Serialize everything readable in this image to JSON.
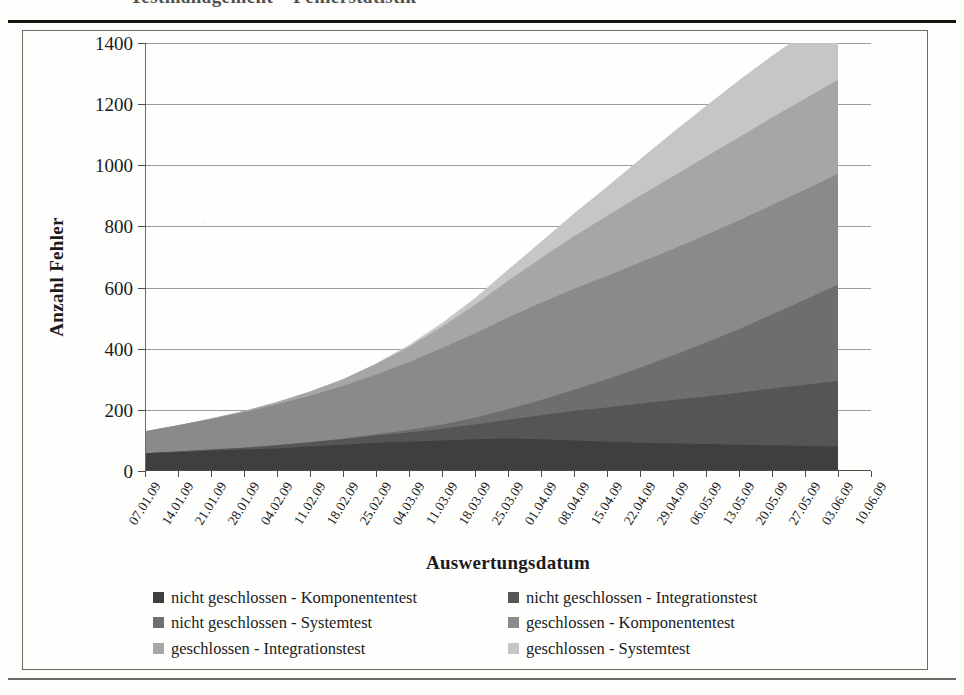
{
  "page": {
    "clipped_heading": "Testmanagement – Fehlerstatistik"
  },
  "chart_data": {
    "type": "area",
    "stacked": true,
    "title": "",
    "xlabel": "Auswertungsdatum",
    "ylabel": "Anzahl Fehler",
    "ylim": [
      0,
      1400
    ],
    "ytick_step": 200,
    "yticks": [
      0,
      200,
      400,
      600,
      800,
      1000,
      1200,
      1400
    ],
    "grid": true,
    "legend_position": "bottom",
    "legend_columns": 2,
    "categories": [
      "07.01.09",
      "14.01.09",
      "21.01.09",
      "28.01.09",
      "04.02.09",
      "11.02.09",
      "18.02.09",
      "25.02.09",
      "04.03.09",
      "11.03.09",
      "18.03.09",
      "25.03.09",
      "01.04.09",
      "08.04.09",
      "15.04.09",
      "22.04.09",
      "29.04.09",
      "06.05.09",
      "13.05.09",
      "20.05.09",
      "27.05.09",
      "03.06.09",
      "10.06.09"
    ],
    "series": [
      {
        "name": "nicht geschlossen - Komponententest",
        "color": "#3f3f3f",
        "values": [
          58,
          62,
          66,
          70,
          74,
          80,
          86,
          92,
          96,
          100,
          104,
          106,
          104,
          100,
          96,
          92,
          90,
          88,
          86,
          84,
          82,
          80,
          null
        ]
      },
      {
        "name": "nicht geschlossen - Integrationstest",
        "color": "#555555",
        "values": [
          0,
          2,
          4,
          6,
          10,
          14,
          18,
          24,
          30,
          38,
          48,
          62,
          78,
          96,
          112,
          128,
          142,
          156,
          170,
          186,
          200,
          214,
          null
        ]
      },
      {
        "name": "nicht geschlossen - Systemtest",
        "color": "#6e6e6e",
        "values": [
          0,
          0,
          0,
          0,
          0,
          0,
          2,
          4,
          8,
          14,
          22,
          34,
          50,
          70,
          92,
          118,
          146,
          176,
          208,
          242,
          278,
          316,
          null
        ]
      },
      {
        "name": "geschlossen - Komponententest",
        "color": "#8a8a8a",
        "values": [
          72,
          86,
          100,
          116,
          134,
          152,
          172,
          196,
          222,
          250,
          276,
          300,
          318,
          330,
          338,
          344,
          348,
          352,
          356,
          358,
          360,
          362,
          null
        ]
      },
      {
        "name": "geschlossen - Integrationstest",
        "color": "#a6a6a6",
        "values": [
          0,
          0,
          2,
          4,
          8,
          14,
          22,
          34,
          50,
          70,
          94,
          120,
          146,
          172,
          196,
          218,
          238,
          256,
          272,
          286,
          298,
          308,
          null
        ]
      },
      {
        "name": "geschlossen - Systemtest",
        "color": "#c6c6c6",
        "values": [
          0,
          0,
          0,
          0,
          0,
          0,
          0,
          2,
          6,
          12,
          22,
          36,
          54,
          74,
          96,
          120,
          144,
          166,
          186,
          202,
          214,
          224,
          null
        ]
      }
    ],
    "totals": [
      130,
      150,
      172,
      196,
      226,
      260,
      300,
      352,
      412,
      484,
      566,
      658,
      750,
      842,
      930,
      1020,
      1108,
      1194,
      1278,
      1358,
      1432,
      1504,
      null
    ],
    "peak_total_label": "1255"
  },
  "legend": {
    "items": [
      {
        "label": "nicht geschlossen - Komponententest",
        "color": "#3f3f3f"
      },
      {
        "label": "nicht geschlossen - Integrationstest",
        "color": "#555555"
      },
      {
        "label": "nicht geschlossen - Systemtest",
        "color": "#6e6e6e"
      },
      {
        "label": "geschlossen - Komponententest",
        "color": "#8a8a8a"
      },
      {
        "label": "geschlossen - Integrationstest",
        "color": "#a6a6a6"
      },
      {
        "label": "geschlossen - Systemtest",
        "color": "#c6c6c6"
      }
    ]
  }
}
